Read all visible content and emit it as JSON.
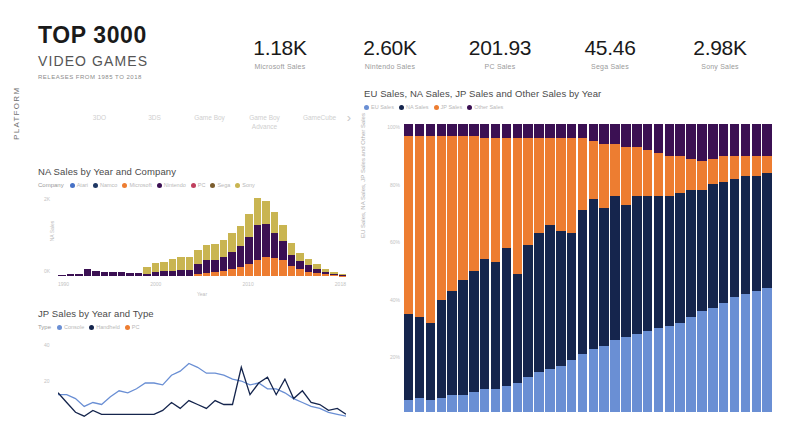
{
  "header": {
    "title_main": "TOP 3000",
    "title_sub": "VIDEO GAMES",
    "title_note": "RELEASES FROM 1985 TO 2018"
  },
  "kpis": [
    {
      "value": "1.18K",
      "label": "Microsoft Sales"
    },
    {
      "value": "2.60K",
      "label": "Nintendo Sales"
    },
    {
      "value": "201.93",
      "label": "PC Sales"
    },
    {
      "value": "45.46",
      "label": "Sega Sales"
    },
    {
      "value": "2.98K",
      "label": "Sony Sales"
    }
  ],
  "slicer": {
    "title": "PLATFORM",
    "items": [
      "3DO",
      "3DS",
      "Game Boy",
      "Game Boy Advance",
      "GameCube"
    ],
    "next_arrow": "›"
  },
  "na_panel": {
    "title": "NA Sales by Year and Company",
    "legend_lead": "Company",
    "legend": [
      {
        "label": "Atari",
        "color": "#4671c6"
      },
      {
        "label": "Namco",
        "color": "#1f3864"
      },
      {
        "label": "Microsoft",
        "color": "#ed7d31"
      },
      {
        "label": "Nintendo",
        "color": "#3b1053"
      },
      {
        "label": "PC",
        "color": "#c0405e"
      },
      {
        "label": "Sega",
        "color": "#7b5d2e"
      },
      {
        "label": "Sony",
        "color": "#c9b551"
      }
    ],
    "ylabel": "NA Sales",
    "xlabel": "Year",
    "yticks": [
      "2K",
      "0K"
    ],
    "xticks": [
      "1990",
      "2000",
      "2010",
      "2018"
    ]
  },
  "jp_panel": {
    "title": "JP Sales by Year and Type",
    "legend_lead": "Type",
    "legend": [
      {
        "label": "Console",
        "color": "#6a8fd4"
      },
      {
        "label": "Handheld",
        "color": "#15254d"
      },
      {
        "label": "PC",
        "color": "#ed7d31"
      }
    ],
    "ylabel": "JP Sales",
    "yticks": [
      "40",
      "20"
    ]
  },
  "big_chart": {
    "title": "EU Sales, NA Sales, JP Sales and Other Sales by Year",
    "legend": [
      {
        "label": "EU Sales",
        "color": "#6a8fd4"
      },
      {
        "label": "NA Sales",
        "color": "#15254d"
      },
      {
        "label": "JP Sales",
        "color": "#ed7d31"
      },
      {
        "label": "Other Sales",
        "color": "#3b1053"
      }
    ],
    "ylabel": "EU Sales, NA Sales, JP Sales and Other Sales",
    "yticks": [
      "100%",
      "80%",
      "60%",
      "40%",
      "20%"
    ]
  },
  "chart_data": [
    {
      "id": "big_stacked",
      "type": "bar",
      "stacked": true,
      "normalized": true,
      "title": "EU Sales, NA Sales, JP Sales and Other Sales by Year",
      "xlabel": "Year",
      "ylabel": "EU Sales, NA Sales, JP Sales and Other Sales",
      "ylim": [
        0,
        100
      ],
      "yticks": [
        20,
        40,
        60,
        80,
        100
      ],
      "legend_position": "top",
      "grid": false,
      "categories": [
        "1985",
        "1986",
        "1987",
        "1988",
        "1989",
        "1990",
        "1991",
        "1992",
        "1993",
        "1994",
        "1995",
        "1996",
        "1997",
        "1998",
        "1999",
        "2000",
        "2001",
        "2002",
        "2003",
        "2004",
        "2005",
        "2006",
        "2007",
        "2008",
        "2009",
        "2010",
        "2011",
        "2012",
        "2013",
        "2014",
        "2015",
        "2016",
        "2017",
        "2018"
      ],
      "series": [
        {
          "name": "EU Sales",
          "color": "#6a8fd4",
          "values": [
            4,
            5,
            4,
            5,
            6,
            6,
            7,
            8,
            8,
            9,
            10,
            12,
            14,
            15,
            16,
            18,
            20,
            22,
            23,
            25,
            26,
            27,
            28,
            29,
            30,
            31,
            33,
            35,
            36,
            38,
            40,
            41,
            42,
            43
          ]
        },
        {
          "name": "NA Sales",
          "color": "#15254d",
          "values": [
            30,
            28,
            27,
            34,
            36,
            40,
            42,
            45,
            44,
            48,
            38,
            46,
            48,
            50,
            47,
            44,
            50,
            52,
            48,
            50,
            46,
            48,
            47,
            46,
            45,
            45,
            44,
            42,
            43,
            42,
            41,
            41,
            40,
            40
          ]
        },
        {
          "name": "JP Sales",
          "color": "#ed7d31",
          "values": [
            62,
            63,
            65,
            57,
            54,
            50,
            47,
            42,
            43,
            38,
            47,
            37,
            33,
            30,
            32,
            33,
            25,
            20,
            22,
            18,
            20,
            17,
            16,
            15,
            14,
            13,
            11,
            10,
            9,
            9,
            8,
            7,
            7,
            6
          ]
        },
        {
          "name": "Other Sales",
          "color": "#3b1053",
          "values": [
            4,
            4,
            4,
            4,
            4,
            4,
            4,
            5,
            5,
            5,
            5,
            5,
            5,
            5,
            5,
            5,
            5,
            6,
            7,
            7,
            8,
            8,
            9,
            10,
            11,
            11,
            12,
            13,
            12,
            11,
            11,
            11,
            11,
            11
          ]
        }
      ]
    },
    {
      "id": "na_sales_by_company",
      "type": "bar",
      "stacked": true,
      "title": "NA Sales by Year and Company",
      "xlabel": "Year",
      "ylabel": "NA Sales",
      "ylim": [
        0,
        2400
      ],
      "yticks": [
        0,
        2000
      ],
      "categories": [
        "1985",
        "1986",
        "1987",
        "1988",
        "1989",
        "1990",
        "1991",
        "1992",
        "1993",
        "1994",
        "1995",
        "1996",
        "1997",
        "1998",
        "1999",
        "2000",
        "2001",
        "2002",
        "2003",
        "2004",
        "2005",
        "2006",
        "2007",
        "2008",
        "2009",
        "2010",
        "2011",
        "2012",
        "2013",
        "2014",
        "2015",
        "2016",
        "2017",
        "2018"
      ],
      "series": [
        {
          "name": "Microsoft",
          "color": "#ed7d31",
          "values": [
            0,
            0,
            0,
            0,
            0,
            0,
            0,
            0,
            0,
            0,
            0,
            0,
            0,
            0,
            0,
            0,
            60,
            90,
            110,
            140,
            190,
            240,
            300,
            420,
            500,
            470,
            420,
            250,
            170,
            110,
            70,
            40,
            20,
            10
          ]
        },
        {
          "name": "Nintendo",
          "color": "#3b1053",
          "values": [
            30,
            60,
            40,
            180,
            120,
            110,
            100,
            95,
            90,
            85,
            60,
            110,
            120,
            130,
            150,
            160,
            260,
            330,
            300,
            360,
            430,
            520,
            700,
            900,
            830,
            640,
            470,
            300,
            210,
            160,
            110,
            70,
            40,
            20
          ]
        },
        {
          "name": "Sony",
          "color": "#c9b551",
          "values": [
            0,
            0,
            0,
            0,
            0,
            0,
            0,
            0,
            0,
            0,
            180,
            230,
            250,
            300,
            340,
            330,
            340,
            380,
            400,
            430,
            480,
            520,
            600,
            680,
            600,
            520,
            430,
            300,
            220,
            170,
            120,
            80,
            50,
            20
          ]
        }
      ]
    },
    {
      "id": "jp_sales_by_type",
      "type": "line",
      "title": "JP Sales by Year and Type",
      "xlabel": "Year",
      "ylabel": "JP Sales",
      "ylim": [
        0,
        45
      ],
      "yticks": [
        20,
        40
      ],
      "x": [
        "1985",
        "1986",
        "1987",
        "1988",
        "1989",
        "1990",
        "1991",
        "1992",
        "1993",
        "1994",
        "1995",
        "1996",
        "1997",
        "1998",
        "1999",
        "2000",
        "2001",
        "2002",
        "2003",
        "2004",
        "2005",
        "2006",
        "2007",
        "2008",
        "2009",
        "2010",
        "2011",
        "2012",
        "2013",
        "2014",
        "2015",
        "2016",
        "2017",
        "2018"
      ],
      "series": [
        {
          "name": "Console",
          "color": "#6a8fd4",
          "values": [
            16,
            16,
            14,
            10,
            12,
            11,
            15,
            18,
            17,
            19,
            22,
            22,
            21,
            26,
            28,
            32,
            30,
            27,
            27,
            26,
            24,
            23,
            21,
            22,
            19,
            19,
            17,
            14,
            12,
            10,
            9,
            7,
            6,
            5
          ]
        },
        {
          "name": "Handheld",
          "color": "#15254d",
          "values": [
            17,
            12,
            7,
            5,
            8,
            6,
            6,
            6,
            6,
            6,
            6,
            6,
            8,
            12,
            9,
            13,
            11,
            9,
            13,
            11,
            11,
            30,
            16,
            22,
            25,
            16,
            24,
            14,
            18,
            12,
            11,
            8,
            9,
            6
          ]
        }
      ]
    }
  ]
}
